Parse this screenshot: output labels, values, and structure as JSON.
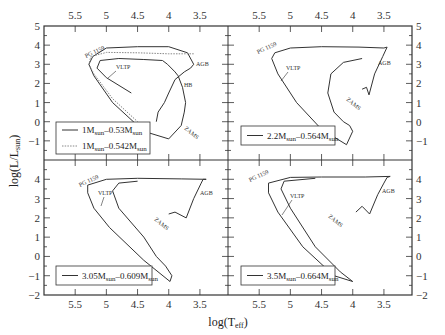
{
  "chart_data": {
    "type": "line",
    "figure_title": "",
    "xlabel": "log(T_eff)",
    "ylabel": "log(L/L_sun)",
    "x_axis_inverted": true,
    "xlim": [
      6.0,
      3.05
    ],
    "ylim": [
      -2,
      5
    ],
    "x_ticks": [
      5.5,
      5,
      4.5,
      4,
      3.5
    ],
    "x_tick_labels": [
      "5.5",
      "5",
      "4.5",
      "4",
      "3.5"
    ],
    "y_ticks_top": [
      5,
      4,
      3,
      2,
      1,
      0,
      -1
    ],
    "y_ticks_bottom": [
      4,
      3,
      2,
      1,
      0,
      -1,
      -2
    ],
    "grid": false,
    "panels": [
      {
        "id": "top-left",
        "legend": [
          {
            "label": "1M_sun–0.53M_sun",
            "style": "solid"
          },
          {
            "label": "1M_sun–0.542M_sun",
            "style": "dotted"
          }
        ],
        "annotations": [
          "PG 1159",
          "VLTP",
          "AGB",
          "HB",
          "ZAMS"
        ],
        "series": [
          {
            "name": "1M_sun–0.53M_sun",
            "style": "solid",
            "x": [
              4.2,
              4.17,
              4.07,
              4.0,
              3.9,
              3.75,
              3.65,
              3.6,
              3.7,
              4.0,
              4.5,
              5.0,
              5.22,
              5.28,
              5.2,
              4.9,
              4.4,
              4.0,
              3.8,
              3.75,
              3.73,
              3.78,
              3.85,
              3.9,
              4.02,
              4.1,
              4.4,
              4.8,
              5.1,
              5.15,
              5.0,
              4.6
            ],
            "y": [
              0.0,
              0.5,
              1.0,
              1.5,
              2.2,
              2.6,
              2.8,
              3.0,
              3.6,
              3.92,
              3.92,
              3.85,
              3.4,
              3.0,
              2.4,
              1.0,
              -0.5,
              -0.9,
              -0.2,
              0.5,
              1.0,
              1.8,
              2.4,
              2.6,
              3.0,
              3.2,
              3.25,
              3.3,
              3.2,
              2.8,
              2.3,
              1.5
            ]
          },
          {
            "name": "1M_sun–0.542M_sun",
            "style": "dotted",
            "x": [
              3.6,
              3.7,
              4.0,
              4.5,
              5.0,
              5.25,
              5.28,
              5.2,
              4.9,
              4.5
            ],
            "y": [
              3.55,
              3.55,
              3.55,
              3.6,
              3.62,
              3.4,
              3.0,
              2.5,
              1.2,
              0.0
            ]
          }
        ]
      },
      {
        "id": "top-right",
        "legend": [
          {
            "label": "2.2M_sun–0.564M_sun",
            "style": "solid"
          }
        ],
        "annotations": [
          "PG 1159",
          "VLTP",
          "AGB",
          "ZAMS"
        ],
        "series": [
          {
            "name": "2.2M_sun–0.564M_sun",
            "style": "solid",
            "x": [
              3.85,
              3.78,
              3.74,
              3.65,
              3.52,
              3.45,
              3.5,
              3.9,
              4.5,
              5.0,
              5.25,
              5.3,
              5.2,
              4.9,
              4.5,
              4.1,
              4.0,
              4.05,
              4.15,
              4.3,
              4.4,
              4.35,
              4.15,
              3.85
            ],
            "y": [
              1.7,
              1.8,
              1.4,
              2.5,
              3.4,
              3.9,
              3.85,
              3.9,
              3.92,
              3.85,
              3.6,
              3.3,
              2.5,
              1.0,
              -0.4,
              -1.2,
              -0.5,
              -0.2,
              0.0,
              0.5,
              1.5,
              2.5,
              3.1,
              3.3
            ]
          }
        ]
      },
      {
        "id": "bottom-left",
        "legend": [
          {
            "label": "3.05M_sun–0.609M_sun",
            "style": "solid"
          }
        ],
        "annotations": [
          "PG 1159",
          "VLTP",
          "AGB",
          "ZAMS"
        ],
        "series": [
          {
            "name": "3.05M_sun–0.609M_sun",
            "style": "solid",
            "x": [
              4.0,
              3.9,
              3.72,
              3.6,
              3.48,
              3.45,
              3.4,
              3.8,
              4.5,
              5.0,
              5.3,
              5.3,
              5.2,
              4.95,
              4.4,
              3.98,
              3.95,
              4.05,
              4.2,
              4.4,
              4.8,
              4.9,
              4.8,
              4.5
            ],
            "y": [
              2.2,
              2.3,
              2.0,
              3.0,
              3.8,
              4.0,
              4.0,
              4.02,
              4.05,
              4.0,
              3.7,
              3.3,
              2.5,
              1.5,
              -0.2,
              -1.3,
              -1.0,
              -0.5,
              0.0,
              1.0,
              2.5,
              3.4,
              3.8,
              3.9
            ]
          }
        ]
      },
      {
        "id": "bottom-right",
        "legend": [
          {
            "label": "3.5M_sun–0.664M_sun",
            "style": "solid"
          }
        ],
        "annotations": [
          "PG 1159",
          "VLTP",
          "AGB",
          "ZAMS"
        ],
        "series": [
          {
            "name": "3.5M_sun–0.664M_sun",
            "style": "solid",
            "x": [
              3.95,
              3.85,
              3.73,
              3.6,
              3.5,
              3.45,
              3.4,
              3.8,
              4.5,
              5.0,
              5.35,
              5.35,
              5.2,
              4.8,
              4.3,
              4.0,
              4.2,
              4.6,
              5.0,
              5.15,
              5.1,
              4.6
            ],
            "y": [
              2.3,
              2.6,
              2.2,
              3.2,
              3.8,
              4.1,
              4.15,
              4.12,
              4.12,
              4.1,
              3.8,
              3.3,
              2.3,
              0.5,
              -1.0,
              -1.3,
              -0.8,
              0.5,
              2.5,
              3.5,
              3.9,
              4.05
            ]
          }
        ]
      }
    ]
  },
  "axes": {
    "x_title": "log(T",
    "x_title_sub": "eff",
    "x_title_close": ")",
    "y_title": "log(L/L",
    "y_title_sub": "sun",
    "y_title_close": ")",
    "x_tick_labels": [
      "5.5",
      "5",
      "4.5",
      "4",
      "3.5"
    ],
    "y_tick_labels_top": [
      "5",
      "4",
      "3",
      "2",
      "1",
      "0",
      "-1"
    ],
    "y_tick_labels_bottom": [
      "4",
      "3",
      "2",
      "1",
      "0",
      "-1",
      "-2"
    ]
  },
  "legends": {
    "tl_1": "1M",
    "tl_1_sub": "sun",
    "tl_1_b": "–0.53M",
    "tl_1_sub2": "sun",
    "tl_2": "1M",
    "tl_2_sub": "sun",
    "tl_2_b": "–0.542M",
    "tl_2_sub2": "sun",
    "tr": "2.2M",
    "tr_sub": "sun",
    "tr_b": "–0.564M",
    "tr_sub2": "sun",
    "bl": "3.05M",
    "bl_sub": "sun",
    "bl_b": "–0.609M",
    "bl_sub2": "sun",
    "br": "3.5M",
    "br_sub": "sun",
    "br_b": "–0.664M",
    "br_sub2": "sun"
  },
  "annotations": {
    "pg1159": "PG 1159",
    "vltp": "VLTP",
    "agb": "AGB",
    "hb": "HB",
    "zams": "ZAMS"
  },
  "colors": {
    "line": "#333333",
    "dotted": "#888888",
    "frame": "#333333"
  }
}
